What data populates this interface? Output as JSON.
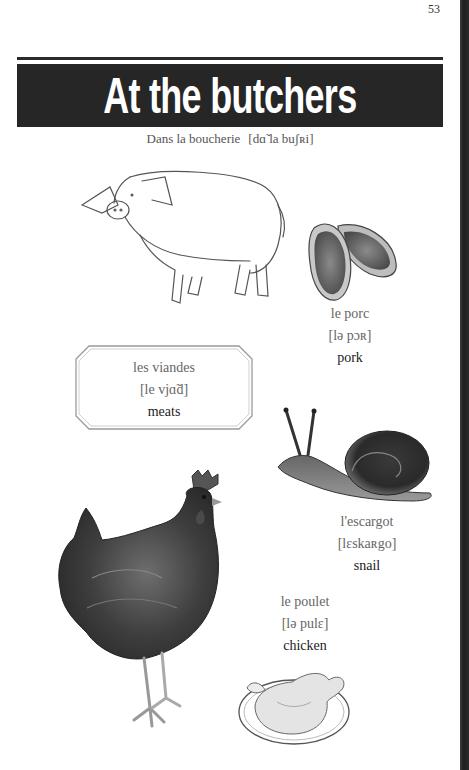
{
  "page": {
    "number": "53",
    "title": "At the butchers",
    "subtitle": "Dans la boucherie",
    "subtitle_ipa": "[dɑ̃ la buʃʀi]"
  },
  "items": [
    {
      "id": "pork",
      "french": "le porc",
      "ipa": "[lə pɔʀ]",
      "english": "pork",
      "illustrations": [
        "pig",
        "pork-chops"
      ]
    },
    {
      "id": "meats",
      "french": "les viandes",
      "ipa": "[le vjɑ̃d]",
      "english": "meats",
      "illustrations": []
    },
    {
      "id": "snail",
      "french": "l'escargot",
      "ipa": "[lɛskaʀgo]",
      "english": "snail",
      "illustrations": [
        "snail"
      ]
    },
    {
      "id": "chicken",
      "french": "le poulet",
      "ipa": "[lə pulɛ]",
      "english": "chicken",
      "illustrations": [
        "hen",
        "roast-chicken"
      ]
    }
  ],
  "colors": {
    "title_bar": "#262626",
    "title_text": "#ffffff",
    "gutter": "#262626",
    "french_text": "#666666",
    "english_text": "#222222"
  }
}
